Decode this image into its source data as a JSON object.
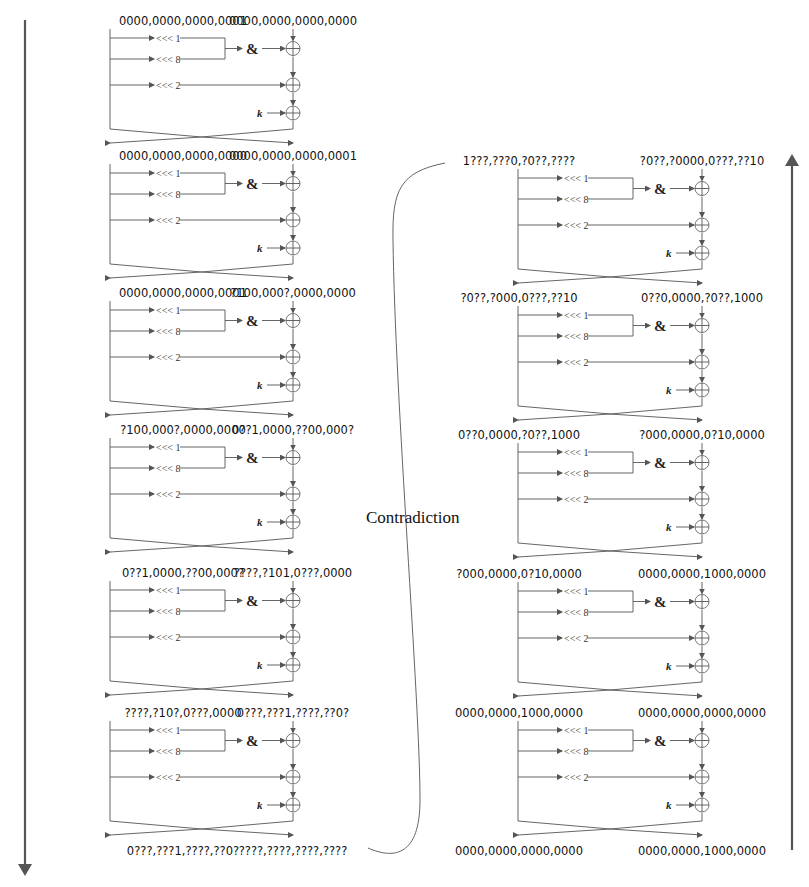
{
  "diagram": {
    "left_column": {
      "direction": "down",
      "states": [
        {
          "left": "0000,0000,0000,0001",
          "right": "0000,0000,0000,0000"
        },
        {
          "left": "0000,0000,0000,0000",
          "right": "0000,0000,0000,0001"
        },
        {
          "left": "0000,0000,0000,0001",
          "right": "?100,000?,0000,0000"
        },
        {
          "left": "?100,000?,0000,0000",
          "right": "0??1,0000,??00,000?"
        },
        {
          "left": "0??1,0000,??00,000?",
          "right": "????,?101,0???,0000"
        },
        {
          "left": "????,?10?,0???,0000",
          "right": "0???,???1,????,??0?"
        },
        {
          "left": "0???,???1,????,??0?",
          "right": "????,????,????,????"
        }
      ]
    },
    "right_column": {
      "direction": "up",
      "states": [
        {
          "left": "1???,???0,?0??,????",
          "right": "?0??,?0000,0???,??10"
        },
        {
          "left": "?0??,?000,0???,??10",
          "right": "0??0,0000,?0??,1000"
        },
        {
          "left": "0??0,0000,?0??,1000",
          "right": "?000,0000,0?10,0000"
        },
        {
          "left": "?000,0000,0?10,0000",
          "right": "0000,0000,1000,0000"
        },
        {
          "left": "0000,0000,1000,0000",
          "right": "0000,0000,0000,0000"
        },
        {
          "left": "0000,0000,0000,0000",
          "right": "0000,0000,1000,0000"
        }
      ]
    },
    "round_ops": {
      "rot1": "<<< 1",
      "rot8": "<<< 8",
      "rot2": "<<< 2",
      "and": "&",
      "key": "k"
    },
    "contradiction_label": "Contradiction",
    "colors": {
      "wire": "#555555",
      "text": "#111111",
      "axis": "#555555"
    }
  }
}
